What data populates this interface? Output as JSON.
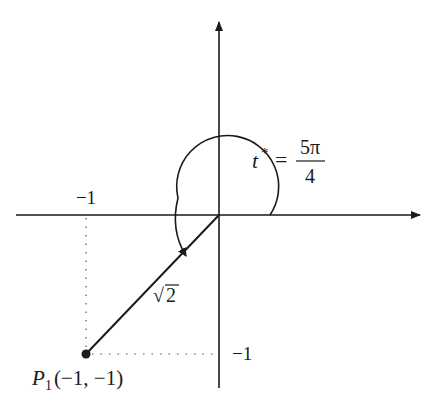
{
  "diagram": {
    "type": "unit-circle-angle",
    "angle_label": {
      "var": "t",
      "superscript": "*",
      "equals": "=",
      "numerator": "5π",
      "denominator": "4"
    },
    "x_tick_label": "−1",
    "y_tick_label": "−1",
    "segment_label_radical": "√",
    "segment_label_value": "2",
    "point": {
      "name": "P",
      "subscript": "1",
      "coords": "(−1, −1)"
    },
    "colors": {
      "ink": "#1a1a1a",
      "background": "#ffffff"
    }
  }
}
